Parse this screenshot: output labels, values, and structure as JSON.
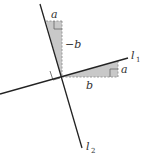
{
  "diagram": {
    "type": "perpendicular-lines-slope",
    "colors": {
      "line": "#222222",
      "fill": "#c8c8c8",
      "dashed": "#888888",
      "text": "#333333"
    },
    "lines": [
      {
        "id": "l1",
        "name": "l",
        "subscript": "1"
      },
      {
        "id": "l2",
        "name": "l",
        "subscript": "2"
      }
    ],
    "triangle_on_l1": {
      "rise_label": "a",
      "run_label": "b"
    },
    "triangle_on_l2": {
      "top_label": "a",
      "side_label": "−b"
    }
  }
}
